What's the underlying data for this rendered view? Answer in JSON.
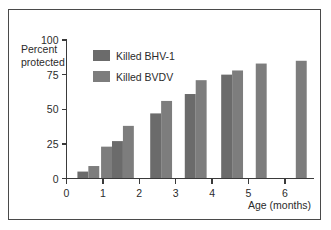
{
  "chart_data": {
    "type": "bar",
    "title": "",
    "xlabel": "Age (months)",
    "ylabel": "Percent protected",
    "ylabel_line1": "Percent",
    "ylabel_line2": "protected",
    "xlim": [
      0,
      6.8
    ],
    "ylim": [
      0,
      100
    ],
    "yticks": [
      0,
      25,
      50,
      75,
      100
    ],
    "ytick_labels": [
      "0",
      "25",
      "50",
      "75",
      "100"
    ],
    "xticks": [
      0,
      1,
      2,
      3,
      4,
      5,
      6
    ],
    "xtick_labels": [
      "0",
      "1",
      "2",
      "3",
      "4",
      "5",
      "6"
    ],
    "grid": false,
    "legend_position": "upper-left-inside",
    "categories": [
      "0",
      "1",
      "2",
      "3",
      "4",
      "5",
      "6"
    ],
    "series": [
      {
        "name": "Killed BHV-1",
        "color": "#6b6b6b",
        "x": [
          0.3,
          1.25,
          2.3,
          3.25,
          4.25
        ],
        "values": [
          5,
          27,
          47,
          61,
          75
        ]
      },
      {
        "name": "Killed BVDV",
        "color": "#7d7d7d",
        "x": [
          0.6,
          0.95,
          1.55,
          2.6,
          3.55,
          4.55,
          5.2,
          6.3
        ],
        "values": [
          9,
          23,
          38,
          56,
          71,
          78,
          83,
          85
        ]
      }
    ],
    "bars": [
      {
        "series": "Killed BHV-1",
        "x": 0.3,
        "value": 5
      },
      {
        "series": "Killed BVDV",
        "x": 0.6,
        "value": 9
      },
      {
        "series": "Killed BVDV",
        "x": 0.95,
        "value": 23
      },
      {
        "series": "Killed BHV-1",
        "x": 1.25,
        "value": 27
      },
      {
        "series": "Killed BVDV",
        "x": 1.55,
        "value": 38
      },
      {
        "series": "Killed BHV-1",
        "x": 2.3,
        "value": 47
      },
      {
        "series": "Killed BVDV",
        "x": 2.6,
        "value": 56
      },
      {
        "series": "Killed BHV-1",
        "x": 3.25,
        "value": 61
      },
      {
        "series": "Killed BVDV",
        "x": 3.55,
        "value": 71
      },
      {
        "series": "Killed BHV-1",
        "x": 4.25,
        "value": 75
      },
      {
        "series": "Killed BVDV",
        "x": 4.55,
        "value": 78
      },
      {
        "series": "Killed BVDV",
        "x": 5.2,
        "value": 83
      },
      {
        "series": "Killed BVDV",
        "x": 6.3,
        "value": 85
      }
    ]
  },
  "legend": {
    "items": [
      {
        "label": "Killed BHV-1",
        "color": "#6b6b6b"
      },
      {
        "label": "Killed BVDV",
        "color": "#7d7d7d"
      }
    ]
  },
  "axes": {
    "y_label_line1": "Percent",
    "y_label_line2": "protected",
    "x_label": "Age (months)",
    "y_ticks": [
      "100",
      "75",
      "50",
      "25",
      "0"
    ],
    "x_ticks": [
      "0",
      "1",
      "2",
      "3",
      "4",
      "5",
      "6"
    ]
  },
  "colors": {
    "frame": "#4a4a4a",
    "axis": "#3a3a3a",
    "background": "#ffffff",
    "bar_bhv1": "#6b6b6b",
    "bar_bvdv": "#7d7d7d",
    "text": "#2b2b2b"
  }
}
